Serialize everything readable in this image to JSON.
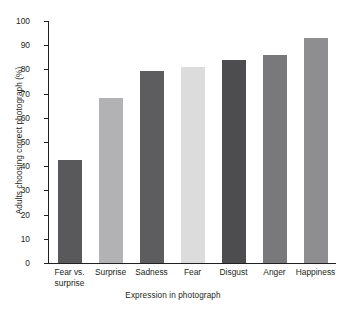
{
  "chart_data": {
    "type": "bar",
    "title": "",
    "xlabel": "Expression in photograph",
    "ylabel": "Adults choosing correct photograph (%)",
    "categories": [
      "Fear vs. surprise",
      "Surprise",
      "Sadness",
      "Fear",
      "Disgust",
      "Anger",
      "Happiness"
    ],
    "category_lines": [
      [
        "Fear vs.",
        "surprise"
      ],
      [
        "Surprise"
      ],
      [
        "Sadness"
      ],
      [
        "Fear"
      ],
      [
        "Disgust"
      ],
      [
        "Anger"
      ],
      [
        "Happiness"
      ]
    ],
    "values": [
      42.5,
      68,
      79.5,
      81,
      84,
      86,
      93
    ],
    "bar_colors": [
      "#59595b",
      "#b2b2b4",
      "#5d5d5f",
      "#dcdcdc",
      "#4d4d4f",
      "#79797b",
      "#8e8e90"
    ],
    "ylim": [
      0,
      100
    ],
    "ytick_step": 10,
    "yticks": [
      0,
      10,
      20,
      30,
      40,
      50,
      60,
      70,
      80,
      90,
      100
    ],
    "grid": false,
    "legend": false,
    "axis_color": "#231f20",
    "background": "#ffffff"
  }
}
